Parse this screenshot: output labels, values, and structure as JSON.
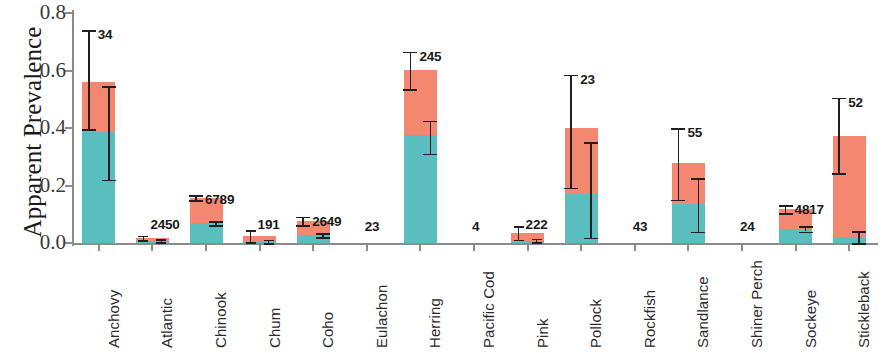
{
  "chart_data": {
    "type": "bar",
    "subtype": "stacked-bar-with-error-bars",
    "title": "",
    "xlabel": "",
    "ylabel": "Apparent Prevalence",
    "ylim": [
      0.0,
      0.8
    ],
    "ytick_labels": [
      "0.0",
      "0.2",
      "0.4",
      "0.6",
      "0.8"
    ],
    "ytick_values": [
      0.0,
      0.2,
      0.4,
      0.6,
      0.8
    ],
    "grid": false,
    "legend": "none",
    "colors": {
      "upper_segment": "#F4876F",
      "lower_segment": "#5BBEBE",
      "axis": "#8c8c8c",
      "error_bar": "#231f20",
      "text": "#1a1a1a",
      "background": "#ffffff"
    },
    "categories": [
      "Anchovy",
      "Atlantic",
      "Chinook",
      "Chum",
      "Coho",
      "Eulachon",
      "Herring",
      "Pacific Cod",
      "Pink",
      "Pollock",
      "Rockfish",
      "Sandlance",
      "Shiner Perch",
      "Sockeye",
      "Stickleback"
    ],
    "sample_size_labels": [
      "34",
      "2450",
      "6789",
      "191",
      "2649",
      "23",
      "245",
      "4",
      "222",
      "23",
      "43",
      "55",
      "24",
      "4817",
      "52"
    ],
    "series": [
      {
        "name": "total (stack top)",
        "values": [
          0.56,
          0.018,
          0.157,
          0.023,
          0.077,
          0.0,
          0.603,
          0.0,
          0.035,
          0.4,
          0.0,
          0.277,
          0.0,
          0.118,
          0.373
        ],
        "error_low": [
          0.395,
          0.01,
          0.148,
          0.003,
          0.062,
          null,
          0.535,
          null,
          0.012,
          0.192,
          null,
          0.15,
          null,
          0.104,
          0.243
        ],
        "error_high": [
          0.74,
          0.026,
          0.167,
          0.044,
          0.092,
          null,
          0.665,
          null,
          0.058,
          0.585,
          null,
          0.4,
          null,
          0.132,
          0.505
        ]
      },
      {
        "name": "lower segment",
        "values": [
          0.385,
          0.008,
          0.068,
          0.005,
          0.027,
          0.0,
          0.377,
          0.0,
          0.008,
          0.172,
          0.0,
          0.137,
          0.0,
          0.049,
          0.02
        ],
        "error_low": [
          0.22,
          0.003,
          0.061,
          0.0,
          0.02,
          null,
          0.31,
          null,
          0.002,
          0.018,
          null,
          0.04,
          null,
          0.04,
          0.0
        ],
        "error_high": [
          0.545,
          0.014,
          0.075,
          0.012,
          0.034,
          null,
          0.425,
          null,
          0.015,
          0.35,
          null,
          0.225,
          null,
          0.058,
          0.042
        ]
      }
    ]
  }
}
